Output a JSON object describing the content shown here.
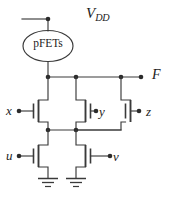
{
  "figure": {
    "kind": "cmos-transistor-schematic",
    "width": 173,
    "height": 200,
    "background_color": "#ffffff",
    "line_color": "#3a3a3a",
    "node_color": "#2b2b2b"
  },
  "labels": {
    "supply_main": "V",
    "supply_sub": "DD",
    "output": "F",
    "pfet_block": "pFETs",
    "input_x": "x",
    "input_y": "y",
    "input_z": "z",
    "input_u": "u",
    "input_v": "v"
  },
  "nodes": {
    "vdd_terminal": {
      "x": 48,
      "y": 19
    },
    "f_rail_left": {
      "x": 48,
      "y": 77
    },
    "f_rail_mid": {
      "x": 76,
      "y": 77
    },
    "f_rail_right": {
      "x": 121,
      "y": 77
    },
    "f_terminal": {
      "x": 141,
      "y": 77
    },
    "mid_rail_left": {
      "x": 48,
      "y": 130
    },
    "mid_rail_mid": {
      "x": 76,
      "y": 130
    },
    "gate_x_terminal": {
      "x": 19,
      "y": 111
    },
    "gate_y_terminal": {
      "x": 96,
      "y": 111
    },
    "gate_z_terminal": {
      "x": 139,
      "y": 111
    },
    "gate_u_terminal": {
      "x": 19,
      "y": 156
    },
    "gate_v_terminal": {
      "x": 110,
      "y": 156
    }
  },
  "transistors": [
    {
      "name": "x",
      "orientation": "gate-left",
      "channel_x": 44,
      "top_y": 100,
      "bottom_y": 122
    },
    {
      "name": "y",
      "orientation": "gate-right",
      "channel_x": 76,
      "top_y": 100,
      "bottom_y": 122
    },
    {
      "name": "z",
      "orientation": "gate-right",
      "channel_x": 121,
      "top_y": 100,
      "bottom_y": 122
    },
    {
      "name": "u",
      "orientation": "gate-left",
      "channel_x": 44,
      "top_y": 145,
      "bottom_y": 167
    },
    {
      "name": "v",
      "orientation": "gate-right",
      "channel_x": 76,
      "top_y": 145,
      "bottom_y": 167
    }
  ],
  "grounds": [
    {
      "x": 48,
      "y": 178
    },
    {
      "x": 76,
      "y": 178
    }
  ]
}
